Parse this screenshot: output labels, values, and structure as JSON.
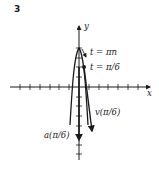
{
  "figure": {
    "number": "3",
    "axes": {
      "x_label": "x",
      "y_label": "y",
      "x_ticks_each_side": 7,
      "y_ticks_up": 4,
      "y_ticks_down": 7
    },
    "annotations": {
      "t_apex": "t = πn",
      "t_point": "t = π/6",
      "velocity": "v(π/6)",
      "acceleration": "a(π/6)"
    },
    "colors": {
      "ink": "#1a1a1a",
      "background": "#ffffff"
    }
  }
}
